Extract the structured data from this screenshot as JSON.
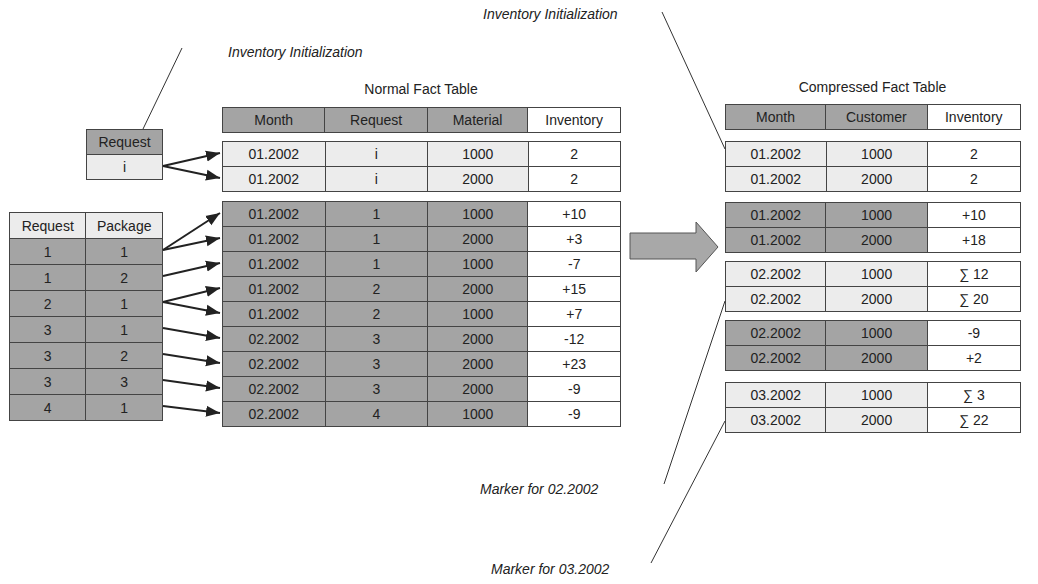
{
  "captions": {
    "init_left": "Inventory Initialization",
    "init_right": "Inventory Initialization",
    "marker_02": "Marker for 02.2002",
    "marker_03": "Marker for 03.2002"
  },
  "request_init_table": {
    "header": "Request",
    "value": "i"
  },
  "request_package_table": {
    "headers": [
      "Request",
      "Package"
    ],
    "rows": [
      [
        "1",
        "1"
      ],
      [
        "1",
        "2"
      ],
      [
        "2",
        "1"
      ],
      [
        "3",
        "1"
      ],
      [
        "3",
        "2"
      ],
      [
        "3",
        "3"
      ],
      [
        "4",
        "1"
      ]
    ]
  },
  "normal_fact_table": {
    "title": "Normal Fact Table",
    "headers": [
      "Month",
      "Request",
      "Material",
      "Inventory"
    ],
    "init_rows": [
      [
        "01.2002",
        "i",
        "1000",
        "2"
      ],
      [
        "01.2002",
        "i",
        "2000",
        "2"
      ]
    ],
    "rows": [
      [
        "01.2002",
        "1",
        "1000",
        "+10"
      ],
      [
        "01.2002",
        "1",
        "2000",
        "+3"
      ],
      [
        "01.2002",
        "1",
        "1000",
        "-7"
      ],
      [
        "01.2002",
        "2",
        "2000",
        "+15"
      ],
      [
        "01.2002",
        "2",
        "1000",
        "+7"
      ],
      [
        "02.2002",
        "3",
        "2000",
        "-12"
      ],
      [
        "02.2002",
        "3",
        "2000",
        "+23"
      ],
      [
        "02.2002",
        "3",
        "2000",
        "-9"
      ],
      [
        "02.2002",
        "4",
        "1000",
        "-9"
      ]
    ]
  },
  "compressed_fact_table": {
    "title": "Compressed Fact Table",
    "headers": [
      "Month",
      "Customer",
      "Inventory"
    ],
    "groups": [
      {
        "style": "light",
        "rows": [
          [
            "01.2002",
            "1000",
            "2"
          ],
          [
            "01.2002",
            "2000",
            "2"
          ]
        ]
      },
      {
        "style": "dark",
        "rows": [
          [
            "01.2002",
            "1000",
            "+10"
          ],
          [
            "01.2002",
            "2000",
            "+18"
          ]
        ]
      },
      {
        "style": "light",
        "rows": [
          [
            "02.2002",
            "1000",
            "∑ 12"
          ],
          [
            "02.2002",
            "2000",
            "∑ 20"
          ]
        ]
      },
      {
        "style": "dark",
        "rows": [
          [
            "02.2002",
            "1000",
            "-9"
          ],
          [
            "02.2002",
            "2000",
            "+2"
          ]
        ]
      },
      {
        "style": "light",
        "rows": [
          [
            "03.2002",
            "1000",
            "∑ 3"
          ],
          [
            "03.2002",
            "2000",
            "∑ 22"
          ]
        ]
      }
    ]
  },
  "colors": {
    "dark_cell": "#a4a4a4",
    "light_cell": "#ececec",
    "border": "#444444",
    "arrow_fill": "#a8a8a8"
  }
}
